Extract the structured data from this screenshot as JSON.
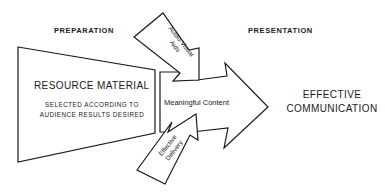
{
  "headers": {
    "left": "PREPARATION",
    "right": "PRESENTATION"
  },
  "resource": {
    "title": "RESOURCE MATERIAL",
    "subtitle_line1": "SELECTED ACCORDING TO",
    "subtitle_line2": "AUDIENCE RESULTS DESIRED"
  },
  "center_arrow": {
    "label": "Meaningful Content"
  },
  "input_arrows": {
    "top_line1": "Audio-Visual",
    "top_line2": "Aids",
    "bottom_line1": "Effective",
    "bottom_line2": "Delivery"
  },
  "outcome": {
    "line1": "EFFECTIVE",
    "line2": "COMMUNICATION"
  },
  "colors": {
    "stroke": "#1a1a1a",
    "background": "#ffffff"
  }
}
